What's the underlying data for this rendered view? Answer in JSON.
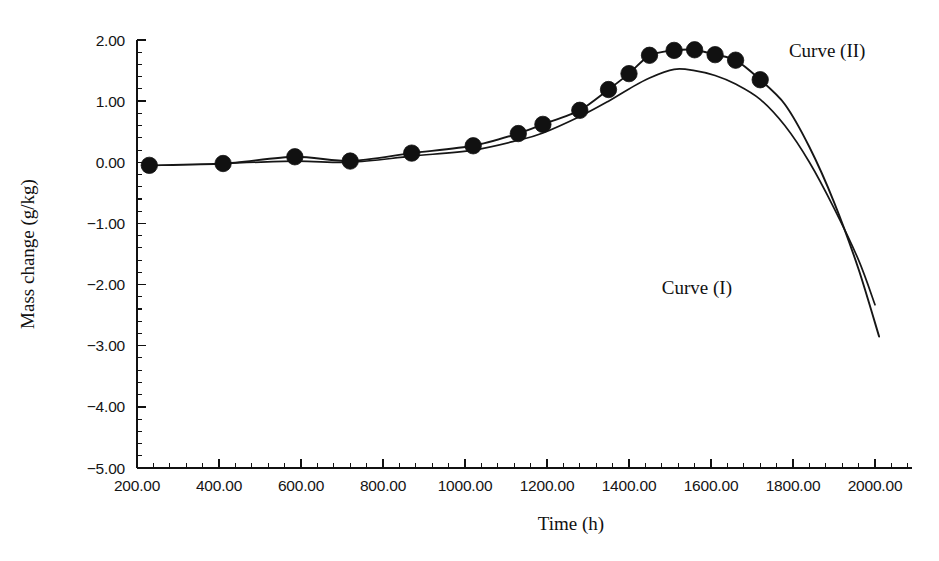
{
  "chart_data": {
    "type": "line",
    "title": "",
    "xlabel": "Time (h)",
    "ylabel": "Mass change (g/kg)",
    "xlim": [
      200,
      2000
    ],
    "ylim": [
      -5.0,
      2.0
    ],
    "grid": false,
    "legend_position": "inline-annotation",
    "x_ticks": [
      200,
      400,
      600,
      800,
      1000,
      1200,
      1400,
      1600,
      1800,
      2000
    ],
    "x_ticklabels": [
      "200.00",
      "400.00",
      "600.00",
      "800.00",
      "1000.00",
      "1200.00",
      "1400.00",
      "1600.00",
      "1800.00",
      "2000.00"
    ],
    "y_ticks": [
      2.0,
      1.0,
      0.0,
      -1.0,
      -2.0,
      -3.0,
      -4.0,
      -5.0
    ],
    "y_ticklabels": [
      "2.00",
      "1.00",
      "0.00",
      "-1.00",
      "-2.00",
      "-3.00",
      "-4.00",
      "-5.00"
    ],
    "x_minor_per_major": 5,
    "y_minor_per_major": 5,
    "series": [
      {
        "name": "Curve (I)",
        "label": "Curve (I)",
        "marker": "none",
        "annotation_x": 1480,
        "annotation_y": -2.15,
        "x": [
          410,
          585,
          720,
          870,
          1020,
          1130,
          1190,
          1280,
          1350,
          1400,
          1450,
          1510,
          1560,
          1610,
          1660,
          1720,
          1780,
          1840,
          1900,
          1960,
          2000
        ],
        "y": [
          -0.02,
          0.02,
          0.0,
          0.1,
          0.2,
          0.36,
          0.48,
          0.75,
          1.0,
          1.2,
          1.38,
          1.52,
          1.5,
          1.42,
          1.28,
          1.03,
          0.6,
          0.0,
          -0.75,
          -1.6,
          -2.33
        ]
      },
      {
        "name": "Curve (II)",
        "label": "Curve (II)",
        "marker": "filled-circle",
        "annotation_x": 1790,
        "annotation_y": 1.73,
        "x": [
          230,
          410,
          585,
          720,
          870,
          1020,
          1130,
          1190,
          1280,
          1350,
          1400,
          1450,
          1510,
          1560,
          1610,
          1660,
          1720,
          1780,
          1840,
          1900,
          1960,
          2010
        ],
        "y": [
          -0.05,
          -0.02,
          0.09,
          0.02,
          0.15,
          0.27,
          0.47,
          0.62,
          0.85,
          1.19,
          1.45,
          1.75,
          1.83,
          1.84,
          1.76,
          1.67,
          1.35,
          0.95,
          0.25,
          -0.65,
          -1.75,
          -2.85
        ],
        "marker_x": [
          230,
          410,
          585,
          720,
          870,
          1020,
          1130,
          1190,
          1280,
          1350,
          1400,
          1450,
          1510,
          1560,
          1610,
          1660,
          1720
        ],
        "marker_y": [
          -0.05,
          -0.02,
          0.09,
          0.02,
          0.15,
          0.27,
          0.47,
          0.62,
          0.85,
          1.19,
          1.45,
          1.75,
          1.83,
          1.84,
          1.76,
          1.67,
          1.35
        ]
      }
    ]
  },
  "axes": {
    "y_title": "Mass change (g/kg)",
    "x_title": "Time (h)"
  },
  "annotations": {
    "curve_one": "Curve (I)",
    "curve_two": "Curve (II)"
  },
  "colors": {
    "ink": "#111111",
    "background": "#ffffff"
  }
}
